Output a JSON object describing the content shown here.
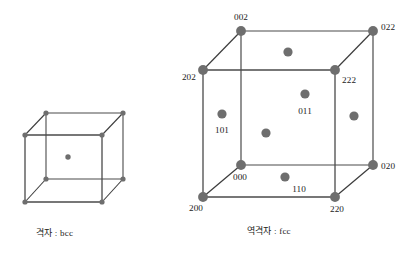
{
  "figure": {
    "background_color": "#ffffff",
    "node_color": "#6e6e6e",
    "edge_color": "#4a4a4a",
    "text_color": "#1b1b1b"
  },
  "left_diagram": {
    "caption": "격자 : bcc",
    "lattice_type": "bcc",
    "cube": {
      "front_bottom_left": [
        25,
        202
      ],
      "front_bottom_right": [
        102,
        202
      ],
      "front_top_left": [
        25,
        135
      ],
      "front_top_right": [
        102,
        135
      ],
      "back_bottom_left": [
        46,
        179
      ],
      "back_bottom_right": [
        123,
        179
      ],
      "back_top_left": [
        46,
        113
      ],
      "back_top_right": [
        123,
        113
      ]
    },
    "corner_nodes": [
      {
        "name": "front-bottom-left",
        "x": 25,
        "y": 202
      },
      {
        "name": "front-bottom-right",
        "x": 102,
        "y": 202
      },
      {
        "name": "front-top-left",
        "x": 25,
        "y": 135
      },
      {
        "name": "front-top-right",
        "x": 102,
        "y": 135
      },
      {
        "name": "back-bottom-left",
        "x": 46,
        "y": 179
      },
      {
        "name": "back-bottom-right",
        "x": 123,
        "y": 179
      },
      {
        "name": "back-top-left",
        "x": 46,
        "y": 113
      },
      {
        "name": "back-top-right",
        "x": 123,
        "y": 113
      }
    ],
    "interior_nodes": [
      {
        "name": "body-center",
        "x": 68,
        "y": 157
      }
    ]
  },
  "right_diagram": {
    "caption": "역격자 : fcc",
    "lattice_type": "fcc",
    "cube": {
      "front_bottom_left": [
        203,
        197
      ],
      "front_bottom_right": [
        335,
        197
      ],
      "front_top_left": [
        203,
        70
      ],
      "front_top_right": [
        335,
        70
      ],
      "back_bottom_left": [
        241,
        165
      ],
      "back_bottom_right": [
        373,
        165
      ],
      "back_top_left": [
        241,
        31
      ],
      "back_top_right": [
        373,
        31
      ]
    },
    "corner_nodes": [
      {
        "name": "node-002",
        "label": "002",
        "x": 241,
        "y": 31,
        "label_x": 241,
        "label_y": 20,
        "anchor": "middle"
      },
      {
        "name": "node-022",
        "label": "022",
        "x": 373,
        "y": 31,
        "label_x": 381,
        "label_y": 30,
        "anchor": "start"
      },
      {
        "name": "node-202",
        "label": "202",
        "x": 203,
        "y": 70,
        "label_x": 196,
        "label_y": 80,
        "anchor": "end"
      },
      {
        "name": "node-222",
        "label": "222",
        "x": 335,
        "y": 70,
        "label_x": 342,
        "label_y": 83,
        "anchor": "start"
      },
      {
        "name": "node-020",
        "label": "020",
        "x": 373,
        "y": 165,
        "label_x": 381,
        "label_y": 169,
        "anchor": "start"
      },
      {
        "name": "node-000",
        "label": "000",
        "x": 241,
        "y": 165,
        "label_x": 240,
        "label_y": 180,
        "anchor": "middle"
      },
      {
        "name": "node-200",
        "label": "200",
        "x": 203,
        "y": 197,
        "label_x": 196,
        "label_y": 211,
        "anchor": "middle"
      },
      {
        "name": "node-220",
        "label": "220",
        "x": 335,
        "y": 197,
        "label_x": 337,
        "label_y": 212,
        "anchor": "middle"
      }
    ],
    "face_nodes": [
      {
        "name": "face-top",
        "label": "",
        "x": 288,
        "y": 52
      },
      {
        "name": "face-011",
        "label": "011",
        "x": 305,
        "y": 94,
        "label_x": 305,
        "label_y": 114,
        "anchor": "middle"
      },
      {
        "name": "face-right",
        "label": "",
        "x": 354,
        "y": 116
      },
      {
        "name": "face-101",
        "label": "101",
        "x": 222,
        "y": 114,
        "label_x": 222,
        "label_y": 133,
        "anchor": "middle"
      },
      {
        "name": "face-center",
        "label": "",
        "x": 266,
        "y": 133
      },
      {
        "name": "face-110",
        "label": "110",
        "x": 285,
        "y": 177,
        "label_x": 299,
        "label_y": 192,
        "anchor": "middle"
      }
    ]
  }
}
